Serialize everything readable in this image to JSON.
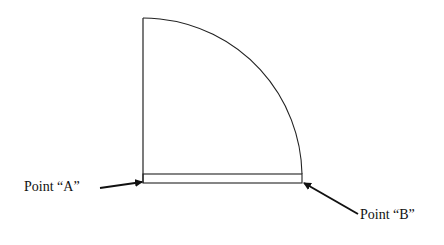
{
  "diagram": {
    "labels": {
      "point_a": "Point “A”",
      "point_b": "Point “B”"
    },
    "colors": {
      "line": "#222222",
      "background": "#ffffff"
    }
  }
}
